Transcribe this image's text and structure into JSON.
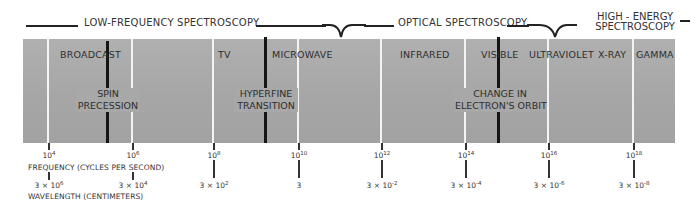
{
  "header": {
    "low_frequency": "LOW-FREQUENCY SPECTROSCOPY",
    "optical": "OPTICAL SPECTROSCOPY",
    "high_energy_line1": "HIGH - ENERGY",
    "high_energy_line2": "SPECTROSCOPY"
  },
  "regions": [
    {
      "label": "BROADCAST"
    },
    {
      "label": "TV"
    },
    {
      "label": "MICROWAVE"
    },
    {
      "label": "INFRARED"
    },
    {
      "label": "VISIBLE"
    },
    {
      "label": "ULTRAVIOLET"
    },
    {
      "label": "X-RAY"
    },
    {
      "label": "GAMMA"
    }
  ],
  "processes": [
    {
      "line1": "SPIN",
      "line2": "PRECESSION"
    },
    {
      "line1": "HYPERFINE",
      "line2": "TRANSITION"
    },
    {
      "line1": "CHANGE  IN",
      "line2": "ELECTRON'S  ORBIT"
    }
  ],
  "axes": {
    "frequency_title": "FREQUENCY (CYCLES PER SECOND)",
    "wavelength_title": "WAVELENGTH (CENTIMETERS)"
  },
  "ticks": [
    {
      "freq_base": "10",
      "freq_exp": "4",
      "wave_mant": "3 × 10",
      "wave_exp": "6"
    },
    {
      "freq_base": "10",
      "freq_exp": "6",
      "wave_mant": "3 × 10",
      "wave_exp": "4"
    },
    {
      "freq_base": "10",
      "freq_exp": "8",
      "wave_mant": "3 × 10",
      "wave_exp": "2"
    },
    {
      "freq_base": "10",
      "freq_exp": "10",
      "wave_mant": "3",
      "wave_exp": ""
    },
    {
      "freq_base": "10",
      "freq_exp": "12",
      "wave_mant": "3 × 10",
      "wave_exp": "-2"
    },
    {
      "freq_base": "10",
      "freq_exp": "14",
      "wave_mant": "3 × 10",
      "wave_exp": "-4"
    },
    {
      "freq_base": "10",
      "freq_exp": "16",
      "wave_mant": "3 × 10",
      "wave_exp": "-6"
    },
    {
      "freq_base": "10",
      "freq_exp": "18",
      "wave_mant": "3 × 10",
      "wave_exp": "-8"
    }
  ],
  "colors": {
    "band": "#a9a9a9",
    "tick_line": "#f4f4f4",
    "marker": "#151515",
    "text": "#2e2e2e"
  }
}
